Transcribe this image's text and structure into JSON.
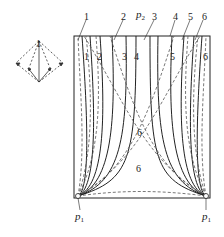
{
  "figure": {
    "top_pressure_label": "p",
    "top_pressure_sub": "2",
    "bottom_left_label": "p",
    "bottom_left_sub": "1",
    "bottom_right_label": "p",
    "bottom_right_sub": "1",
    "top_line_labels": [
      "1",
      "2",
      "3",
      "4",
      "5",
      "6"
    ],
    "inner_line_labels": [
      "1",
      "2",
      "3",
      "4",
      "5",
      "6"
    ],
    "center_labels": [
      "6",
      "6"
    ],
    "vector_diagram_label": "1",
    "line_color": "#222222",
    "dashed_color": "#555555"
  }
}
